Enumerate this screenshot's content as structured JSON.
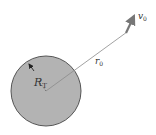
{
  "diagram": {
    "planet": {
      "center": [
        46,
        91
      ],
      "radius": 35,
      "fill": "#b3b3b3",
      "stroke": "#555555"
    },
    "radius_label": {
      "main": "R",
      "sub": "T"
    },
    "distance_label": {
      "main": "r",
      "sub": "0"
    },
    "velocity_label": {
      "main": "v",
      "sub": "0"
    },
    "position_line": {
      "from": [
        46,
        91
      ],
      "to": [
        127,
        32
      ],
      "color": "#888888"
    },
    "velocity_arrow": {
      "from": [
        126,
        33
      ],
      "to": [
        136,
        12
      ],
      "color": "#777777"
    }
  }
}
